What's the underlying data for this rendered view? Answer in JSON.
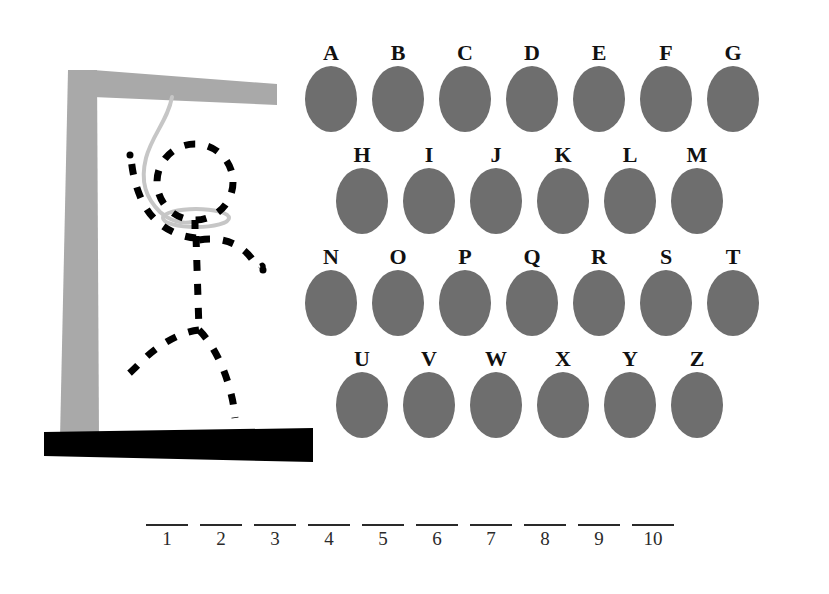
{
  "game": {
    "title": "Hangman",
    "theme": {
      "background": "#ffffff",
      "key_fill": "#6e6e6e",
      "key_label": "#111111",
      "gallows_post": "#a9a9a9",
      "gallows_base": "#000000",
      "rope": "#c6c6c6",
      "figure": "#000000",
      "blank_line": "#2a2a2a"
    }
  },
  "gallows": {
    "post_label": "gallows-post",
    "beam_label": "gallows-beam",
    "base_label": "gallows-base",
    "rope_label": "rope",
    "noose_label": "noose-loop",
    "figure_parts": [
      "head",
      "torso",
      "left-arm",
      "right-arm",
      "left-leg",
      "right-leg"
    ],
    "wrong_guesses": 6
  },
  "keypad": {
    "rows": [
      {
        "indented": false,
        "keys": [
          "A",
          "B",
          "C",
          "D",
          "E",
          "F",
          "G"
        ]
      },
      {
        "indented": true,
        "keys": [
          "H",
          "I",
          "J",
          "K",
          "L",
          "M"
        ]
      },
      {
        "indented": false,
        "keys": [
          "N",
          "O",
          "P",
          "Q",
          "R",
          "S",
          "T"
        ]
      },
      {
        "indented": true,
        "keys": [
          "U",
          "V",
          "W",
          "X",
          "Y",
          "Z"
        ]
      }
    ]
  },
  "answer": {
    "length": 10,
    "blanks": [
      {
        "number": "1",
        "letter": ""
      },
      {
        "number": "2",
        "letter": ""
      },
      {
        "number": "3",
        "letter": ""
      },
      {
        "number": "4",
        "letter": ""
      },
      {
        "number": "5",
        "letter": ""
      },
      {
        "number": "6",
        "letter": ""
      },
      {
        "number": "7",
        "letter": ""
      },
      {
        "number": "8",
        "letter": ""
      },
      {
        "number": "9",
        "letter": ""
      },
      {
        "number": "10",
        "letter": ""
      }
    ]
  }
}
